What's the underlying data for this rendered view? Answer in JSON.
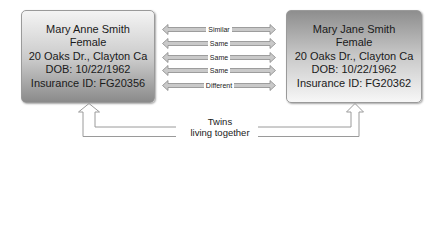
{
  "left_person": {
    "name": "Mary Anne Smith",
    "gender": "Female",
    "address": "20 Oaks Dr., Clayton Ca",
    "dob": "DOB: 10/22/1962",
    "insurance": "Insurance ID: FG20356"
  },
  "right_person": {
    "name": "Mary Jane Smith",
    "gender": "Female",
    "address": "20 Oaks Dr., Clayton Ca",
    "dob": "DOB: 10/22/1962",
    "insurance": "Insurance ID: FG20362"
  },
  "comparisons": [
    {
      "field": "name",
      "label": "Similar"
    },
    {
      "field": "gender",
      "label": "Same"
    },
    {
      "field": "address",
      "label": "Same"
    },
    {
      "field": "dob",
      "label": "Same"
    },
    {
      "field": "insurance",
      "label": "Different"
    }
  ],
  "relationship": {
    "line1": "Twins",
    "line2": "living together"
  },
  "colors": {
    "arrow_fill": "#c9c9c9",
    "arrow_stroke": "#8a8a8a",
    "box_border": "#9a9a9a"
  }
}
